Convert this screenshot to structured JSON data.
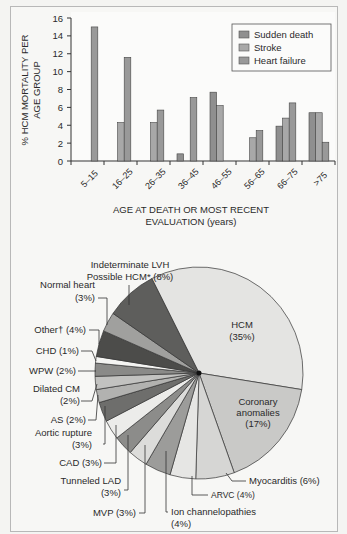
{
  "chart_data": [
    {
      "type": "bar",
      "title": "",
      "xlabel": "AGE AT DEATH OR MOST RECENT EVALUATION (years)",
      "xlabel_lines": [
        "AGE AT DEATH OR MOST RECENT",
        "EVALUATION (years)"
      ],
      "ylabel": "% HCM MORTALITY PER AGE GROUP",
      "ylabel_lines": [
        "% HCM MORTALITY PER",
        "AGE GROUP"
      ],
      "ylim": [
        0,
        16
      ],
      "yticks": [
        0,
        2,
        4,
        6,
        8,
        10,
        12,
        14,
        16
      ],
      "grid": false,
      "legend_position": "upper right",
      "categories": [
        "5–15",
        "16–25",
        "26–35",
        "36–45",
        "46–55",
        "56–65",
        "66–75",
        ">75"
      ],
      "series": [
        {
          "name": "Sudden death",
          "color": "#8f8f8f",
          "values": [
            null,
            null,
            null,
            0.8,
            7.7,
            null,
            3.9,
            5.4
          ]
        },
        {
          "name": "Stroke",
          "color": "#a8a8a8",
          "values": [
            null,
            4.3,
            4.3,
            null,
            6.2,
            2.6,
            4.8,
            5.4
          ]
        },
        {
          "name": "Heart failure",
          "color": "#999999",
          "values": [
            15.0,
            11.6,
            5.7,
            7.1,
            null,
            3.4,
            6.5,
            2.1
          ]
        }
      ]
    },
    {
      "type": "pie",
      "title": "",
      "slices": [
        {
          "label": "HCM",
          "value": 35,
          "label_text": "HCM",
          "pct_text": "(35%)",
          "color": "#e4e4e2"
        },
        {
          "label": "Coronary anomalies",
          "value": 17,
          "label_text": "Coronary anomalies",
          "pct_text": "(17%)",
          "color": "#c9c9c7"
        },
        {
          "label": "Myocarditis",
          "value": 6,
          "label_text": "Myocarditis (6%)",
          "color": "#d6d6d4"
        },
        {
          "label": "ARVC",
          "value": 4,
          "label_text": "ARVC (4%)",
          "color": "#e6e6e4"
        },
        {
          "label": "Ion channelopathies",
          "value": 4,
          "label_text": "Ion channelopathies (4%)",
          "color": "#9c9c9a"
        },
        {
          "label": "MVP",
          "value": 3,
          "label_text": "MVP (3%)",
          "color": "#dcdcda"
        },
        {
          "label": "Tunneled LAD",
          "value": 3,
          "label_text": "Tunneled LAD (3%)",
          "color": "#8c8c8a"
        },
        {
          "label": "CAD",
          "value": 3,
          "label_text": "CAD (3%)",
          "color": "#ececea"
        },
        {
          "label": "Aortic rupture",
          "value": 3,
          "label_text": "Aortic rupture (3%)",
          "color": "#6e6e6c"
        },
        {
          "label": "AS",
          "value": 2,
          "label_text": "AS (2%)",
          "color": "#b2b2b0"
        },
        {
          "label": "Dilated CM",
          "value": 2,
          "label_text": "Dilated CM (2%)",
          "color": "#c2c2c0"
        },
        {
          "label": "WPW",
          "value": 2,
          "label_text": "WPW (2%)",
          "color": "#8a8a88"
        },
        {
          "label": "CHD",
          "value": 1,
          "label_text": "CHD (1%)",
          "color": "#f4f4f2"
        },
        {
          "label": "Other†",
          "value": 4,
          "label_text": "Other† (4%)",
          "color": "#4c4c4a"
        },
        {
          "label": "Normal heart",
          "value": 3,
          "label_text": "Normal heart (3%)",
          "color": "#a0a09e"
        },
        {
          "label": "Indeterminate LVH Possible HCM*",
          "value": 8,
          "label_text": "Indeterminate LVH Possible HCM* (8%)",
          "color": "#5e5e5c"
        }
      ]
    }
  ],
  "bar": {
    "yticks": [
      "0",
      "2",
      "4",
      "6",
      "8",
      "10",
      "12",
      "14",
      "16"
    ],
    "ylabel_line1": "% HCM MORTALITY PER",
    "ylabel_line2": "AGE GROUP",
    "categories": [
      "5–15",
      "16–25",
      "26–35",
      "36–45",
      "46–55",
      "56–65",
      "66–75",
      ">75"
    ],
    "xlabel_line1": "AGE AT DEATH OR MOST RECENT",
    "xlabel_line2": "EVALUATION (years)",
    "legend": [
      "Sudden death",
      "Stroke",
      "Heart failure"
    ]
  },
  "pie": {
    "hcm_l1": "HCM",
    "hcm_l2": "(35%)",
    "cor_l1": "Coronary",
    "cor_l2": "anomalies",
    "cor_l3": "(17%)",
    "myo": "Myocarditis (6%)",
    "arvc": "ARVC (4%)",
    "ion_l1": "Ion channelopathies",
    "ion_l2": "(4%)",
    "mvp": "MVP (3%)",
    "tlad_l1": "Tunneled LAD",
    "tlad_l2": "(3%)",
    "cad": "CAD (3%)",
    "aort_l1": "Aortic rupture",
    "aort_l2": "(3%)",
    "as": "AS (2%)",
    "dcm_l1": "Dilated CM",
    "dcm_l2": "(2%)",
    "wpw": "WPW (2%)",
    "chd": "CHD (1%)",
    "other": "Other† (4%)",
    "normal_l1": "Normal heart",
    "normal_l2": "(3%)",
    "lvh_l1": "Indeterminate LVH",
    "lvh_l2": "Possible HCM* (8%)"
  }
}
